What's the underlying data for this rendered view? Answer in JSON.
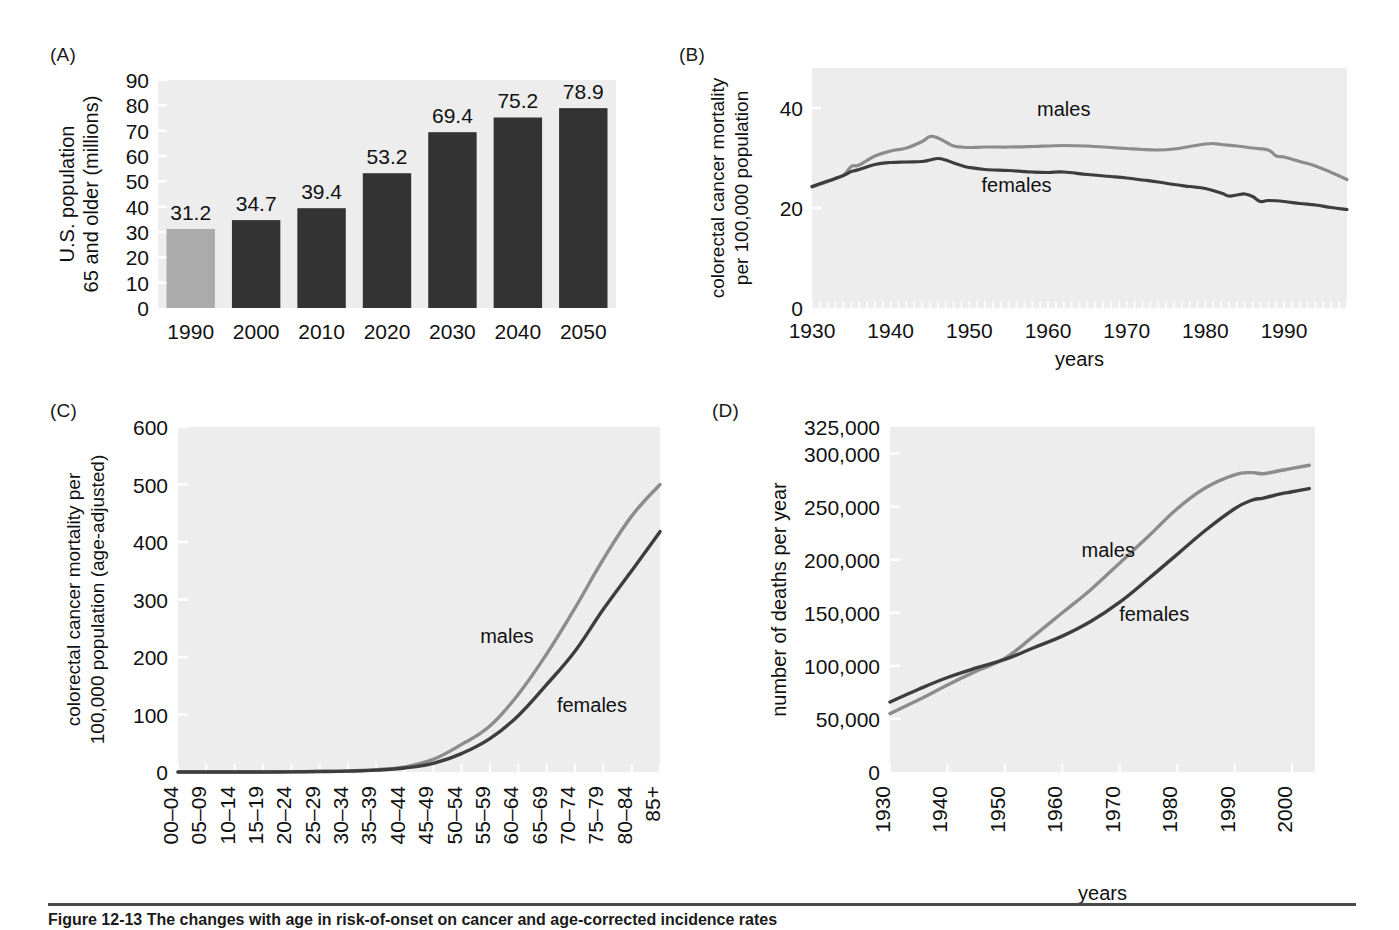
{
  "figure": {
    "panel_labels": {
      "a": "(A)",
      "b": "(B)",
      "c": "(C)",
      "d": "(D)"
    },
    "caption": "Figure 12-13 The changes with age in risk-of-onset on cancer and age-corrected incidence rates",
    "colors": {
      "plot_background": "#ededed",
      "males_line": "#8c8c8c",
      "females_line": "#3d3d3d",
      "bar_highlight": "#ababab",
      "bar_main": "#333333",
      "text": "#111111"
    }
  },
  "chart_data": [
    {
      "panel": "(A)",
      "type": "bar",
      "title": "",
      "xlabel": "",
      "ylabel": "U.S. population 65 and older (millions)",
      "ylabel_lines": [
        "U.S. population",
        "65 and older (millions)"
      ],
      "categories": [
        "1990",
        "2000",
        "2010",
        "2020",
        "2030",
        "2040",
        "2050"
      ],
      "values": [
        31.2,
        34.7,
        39.4,
        53.2,
        69.4,
        75.2,
        78.9
      ],
      "data_labels": [
        "31.2",
        "34.7",
        "39.4",
        "53.2",
        "69.4",
        "75.2",
        "78.9"
      ],
      "bar_colors": [
        "#ababab",
        "#333333",
        "#333333",
        "#333333",
        "#333333",
        "#333333",
        "#333333"
      ],
      "ylim": [
        0,
        90
      ],
      "yticks": [
        0,
        10,
        20,
        30,
        40,
        50,
        60,
        70,
        80,
        90
      ],
      "ytick_labels": [
        "0",
        "10",
        "20",
        "30",
        "40",
        "50",
        "60",
        "70",
        "80",
        "90"
      ],
      "grid": false,
      "legend": "none"
    },
    {
      "panel": "(B)",
      "type": "line",
      "title": "",
      "xlabel": "years",
      "ylabel": "colorectal cancer mortality per 100,000 population",
      "ylabel_lines": [
        "colorectal cancer mortality",
        "per 100,000 population"
      ],
      "xlim": [
        1930,
        1998
      ],
      "ylim": [
        0,
        48
      ],
      "xticks": [
        1930,
        1940,
        1950,
        1960,
        1970,
        1980,
        1990
      ],
      "xtick_labels": [
        "1930",
        "1940",
        "1950",
        "1960",
        "1970",
        "1980",
        "1990"
      ],
      "yticks": [
        0,
        20,
        40
      ],
      "ytick_labels": [
        "0",
        "20",
        "40"
      ],
      "minor_xticks": true,
      "grid": false,
      "legend": "inline-annotations",
      "annotations": [
        {
          "text": "males",
          "x": 1962,
          "y": 38.5,
          "color": "#8c8c8c"
        },
        {
          "text": "females",
          "x": 1956,
          "y": 23.2,
          "color": "#3d3d3d"
        }
      ],
      "series": [
        {
          "name": "males",
          "color": "#8c8c8c",
          "x": [
            1930,
            1932,
            1934,
            1935,
            1936,
            1938,
            1940,
            1942,
            1944,
            1945,
            1946,
            1947,
            1948,
            1949,
            1950,
            1952,
            1955,
            1958,
            1960,
            1962,
            1965,
            1968,
            1970,
            1972,
            1974,
            1976,
            1978,
            1980,
            1981,
            1982,
            1984,
            1986,
            1988,
            1989,
            1990,
            1992,
            1994,
            1996,
            1998
          ],
          "values": [
            24.2,
            25.3,
            26.6,
            28.3,
            28.6,
            30.4,
            31.4,
            32.0,
            33.3,
            34.3,
            34.0,
            33.2,
            32.4,
            32.2,
            32.1,
            32.2,
            32.2,
            32.3,
            32.4,
            32.5,
            32.4,
            32.1,
            31.9,
            31.7,
            31.6,
            31.8,
            32.3,
            32.8,
            32.9,
            32.7,
            32.4,
            32.0,
            31.6,
            30.4,
            30.2,
            29.3,
            28.4,
            27.1,
            25.7
          ]
        },
        {
          "name": "females",
          "color": "#3d3d3d",
          "x": [
            1930,
            1932,
            1934,
            1935,
            1936,
            1938,
            1940,
            1942,
            1944,
            1945,
            1946,
            1947,
            1948,
            1949,
            1950,
            1952,
            1955,
            1958,
            1960,
            1962,
            1965,
            1968,
            1970,
            1972,
            1974,
            1976,
            1978,
            1980,
            1982,
            1983,
            1984,
            1985,
            1986,
            1987,
            1988,
            1990,
            1992,
            1994,
            1996,
            1998
          ],
          "values": [
            24.3,
            25.4,
            26.5,
            27.3,
            27.7,
            28.7,
            29.1,
            29.2,
            29.3,
            29.6,
            29.9,
            29.6,
            29.0,
            28.5,
            28.1,
            27.7,
            27.5,
            27.2,
            27.1,
            27.2,
            26.7,
            26.3,
            26.0,
            25.6,
            25.2,
            24.7,
            24.3,
            23.9,
            23.0,
            22.4,
            22.6,
            22.8,
            22.3,
            21.3,
            21.5,
            21.3,
            20.9,
            20.6,
            20.1,
            19.7
          ]
        }
      ]
    },
    {
      "panel": "(C)",
      "type": "line",
      "title": "",
      "xlabel": "",
      "ylabel": "colorectal cancer mortality per 100,000 population (age-adjusted)",
      "ylabel_lines": [
        "colorectal cancer mortality per",
        "100,000 population (age-adjusted)"
      ],
      "categories": [
        "00–04",
        "05–09",
        "10–14",
        "15–19",
        "20–24",
        "25–29",
        "30–34",
        "35–39",
        "40–44",
        "45–49",
        "50–54",
        "55–59",
        "60–64",
        "65–69",
        "70–74",
        "75–79",
        "80–84",
        "85+"
      ],
      "ylim": [
        0,
        600
      ],
      "yticks": [
        0,
        100,
        200,
        300,
        400,
        500,
        600
      ],
      "ytick_labels": [
        "0",
        "100",
        "200",
        "300",
        "400",
        "500",
        "600"
      ],
      "grid": false,
      "legend": "inline-annotations",
      "annotations": [
        {
          "text": "males",
          "x_index": 11.6,
          "y": 225,
          "color": "#8c8c8c"
        },
        {
          "text": "females",
          "x_index": 14.6,
          "y": 105,
          "color": "#3d3d3d"
        }
      ],
      "series": [
        {
          "name": "males",
          "color": "#8c8c8c",
          "values": [
            0,
            0,
            0,
            0,
            0.4,
            1,
            2,
            4,
            9,
            22,
            48,
            80,
            135,
            205,
            285,
            370,
            445,
            500
          ]
        },
        {
          "name": "females",
          "color": "#3d3d3d",
          "values": [
            0,
            0,
            0,
            0,
            0.3,
            0.8,
            1.6,
            3.2,
            7,
            15,
            32,
            58,
            98,
            152,
            210,
            283,
            350,
            418
          ]
        }
      ]
    },
    {
      "panel": "(D)",
      "type": "line",
      "title": "",
      "xlabel": "years",
      "ylabel": "number of deaths per year",
      "ylabel_lines": [
        "number of deaths per year"
      ],
      "xlim": [
        1930,
        2004
      ],
      "ylim": [
        0,
        325000
      ],
      "xticks": [
        1930,
        1940,
        1950,
        1960,
        1970,
        1980,
        1990,
        2000
      ],
      "xtick_labels": [
        "1930",
        "1940",
        "1950",
        "1960",
        "1970",
        "1980",
        "1990",
        "2000"
      ],
      "yticks": [
        0,
        50000,
        100000,
        150000,
        200000,
        250000,
        300000,
        325000
      ],
      "ytick_labels": [
        "0",
        "50,000",
        "100,000",
        "150,000",
        "200,000",
        "250,000",
        "300,000",
        "325,000"
      ],
      "grid": false,
      "legend": "inline-annotations",
      "annotations": [
        {
          "text": "males",
          "x": 1968,
          "y": 203000,
          "color": "#8c8c8c"
        },
        {
          "text": "females",
          "x": 1976,
          "y": 142000,
          "color": "#3d3d3d"
        }
      ],
      "series": [
        {
          "name": "males",
          "color": "#8c8c8c",
          "x": [
            1930,
            1935,
            1940,
            1945,
            1950,
            1955,
            1960,
            1965,
            1970,
            1975,
            1980,
            1985,
            1990,
            1993,
            1995,
            1998,
            2000,
            2003
          ],
          "values": [
            55000,
            68000,
            82000,
            95000,
            107000,
            128000,
            150000,
            172000,
            197000,
            222000,
            248000,
            268000,
            280000,
            282000,
            281000,
            284000,
            286000,
            289000
          ]
        },
        {
          "name": "females",
          "color": "#3d3d3d",
          "x": [
            1930,
            1935,
            1940,
            1945,
            1950,
            1955,
            1960,
            1965,
            1970,
            1975,
            1980,
            1985,
            1990,
            1993,
            1995,
            1998,
            2000,
            2003
          ],
          "values": [
            66000,
            78000,
            89000,
            98000,
            106000,
            117000,
            128000,
            142000,
            160000,
            182000,
            205000,
            228000,
            248000,
            256000,
            258000,
            262000,
            264000,
            267000
          ]
        }
      ]
    }
  ]
}
